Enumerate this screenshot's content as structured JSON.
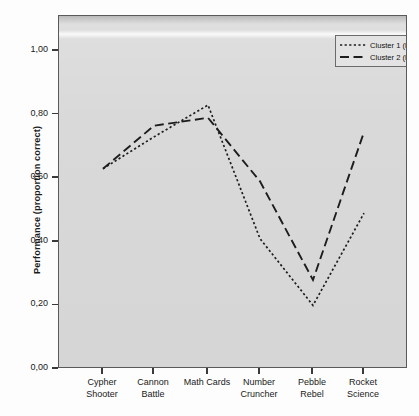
{
  "chart_data": {
    "type": "line",
    "title": "",
    "xlabel": "",
    "ylabel": "Performance (proportion correct)",
    "categories": [
      "Cypher Shooter",
      "Cannon Battle",
      "Math Cards",
      "Number Cruncher",
      "Pebble Rebel",
      "Rocket Science"
    ],
    "category_lines": [
      [
        "Cypher",
        "Shooter"
      ],
      [
        "Cannon",
        "Battle"
      ],
      [
        "Math Cards",
        ""
      ],
      [
        "Number",
        "Cruncher"
      ],
      [
        "Pebble",
        "Rebel"
      ],
      [
        "Rocket",
        "Science"
      ]
    ],
    "series": [
      {
        "name": "Cluster 1 (low gaming skills)",
        "style": "dotted",
        "values": [
          0.63,
          0.73,
          0.83,
          0.41,
          0.2,
          0.49
        ]
      },
      {
        "name": "Cluster 2 (high gaming skills)",
        "style": "dashed",
        "values": [
          0.63,
          0.765,
          0.79,
          0.59,
          0.28,
          0.745
        ]
      }
    ],
    "ylim": [
      0.0,
      1.08
    ],
    "yticks": [
      0.0,
      0.2,
      0.4,
      0.6,
      0.8,
      1.0
    ],
    "ytick_labels": [
      "0,00",
      "0,20",
      "0,40",
      "0,60",
      "0,80",
      "1,00"
    ],
    "grid": false,
    "legend_position": "top-right",
    "line_color": "#1d1d1d",
    "panel_color": "#d9d9d9"
  },
  "legend": {
    "items": [
      {
        "label": "Cluster 1 (low gaming skills)",
        "style": "dotted"
      },
      {
        "label": "Cluster 2 (high gaming skills)",
        "style": "dashed"
      }
    ]
  }
}
